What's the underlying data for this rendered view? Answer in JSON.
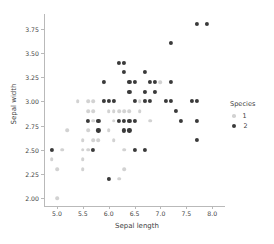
{
  "chart_data": {
    "type": "scatter",
    "title": "",
    "xlabel": "Sepal length",
    "ylabel": "Sepal width",
    "xlim": [
      4.75,
      8.15
    ],
    "ylim": [
      1.92,
      3.88
    ],
    "xticks": [
      "5.0",
      "5.5",
      "6.0",
      "6.5",
      "7.0",
      "7.5",
      "8.0"
    ],
    "xtick_values": [
      5.0,
      5.5,
      6.0,
      6.5,
      7.0,
      7.5,
      8.0
    ],
    "yticks": [
      "2.00",
      "2.25",
      "2.50",
      "2.75",
      "3.00",
      "3.25",
      "3.50",
      "3.75"
    ],
    "ytick_values": [
      2.0,
      2.25,
      2.5,
      2.75,
      3.0,
      3.25,
      3.5,
      3.75
    ],
    "grid": false,
    "legend": {
      "title": "Species",
      "position": "right",
      "entries": [
        {
          "label": "1",
          "color": "#d2d2d2"
        },
        {
          "label": "2",
          "color": "#3a3a3a"
        }
      ]
    },
    "series": [
      {
        "name": "1",
        "color": "#d2d2d2",
        "points": [
          [
            4.9,
            2.4
          ],
          [
            5.0,
            2.3
          ],
          [
            5.0,
            2.0
          ],
          [
            5.1,
            2.5
          ],
          [
            5.2,
            2.7
          ],
          [
            5.4,
            3.0
          ],
          [
            5.5,
            2.6
          ],
          [
            5.5,
            2.5
          ],
          [
            5.5,
            2.4
          ],
          [
            5.5,
            2.3
          ],
          [
            5.6,
            3.0
          ],
          [
            5.6,
            2.9
          ],
          [
            5.6,
            2.7
          ],
          [
            5.6,
            2.5
          ],
          [
            5.7,
            3.0
          ],
          [
            5.7,
            2.9
          ],
          [
            5.7,
            2.8
          ],
          [
            5.7,
            2.6
          ],
          [
            5.8,
            2.7
          ],
          [
            5.8,
            2.6
          ],
          [
            5.9,
            3.2
          ],
          [
            5.9,
            3.0
          ],
          [
            6.0,
            2.9
          ],
          [
            6.0,
            2.7
          ],
          [
            6.0,
            2.2
          ],
          [
            6.1,
            3.0
          ],
          [
            6.1,
            2.9
          ],
          [
            6.1,
            2.8
          ],
          [
            6.1,
            2.6
          ],
          [
            6.2,
            2.9
          ],
          [
            6.2,
            2.2
          ],
          [
            6.3,
            3.4
          ],
          [
            6.3,
            2.9
          ],
          [
            6.3,
            2.5
          ],
          [
            6.3,
            2.3
          ],
          [
            6.4,
            2.9
          ],
          [
            6.5,
            2.8
          ],
          [
            6.6,
            3.0
          ],
          [
            6.6,
            2.9
          ],
          [
            6.7,
            3.1
          ],
          [
            6.7,
            3.0
          ],
          [
            6.8,
            2.8
          ],
          [
            6.9,
            3.1
          ],
          [
            7.0,
            3.2
          ],
          [
            7.7,
            2.8
          ]
        ]
      },
      {
        "name": "2",
        "color": "#3a3a3a",
        "points": [
          [
            4.9,
            2.5
          ],
          [
            5.6,
            2.8
          ],
          [
            5.7,
            2.5
          ],
          [
            5.8,
            2.8
          ],
          [
            5.8,
            2.7
          ],
          [
            5.9,
            3.0
          ],
          [
            5.9,
            3.2
          ],
          [
            6.0,
            3.0
          ],
          [
            6.0,
            2.2
          ],
          [
            6.1,
            3.0
          ],
          [
            6.2,
            3.4
          ],
          [
            6.2,
            2.8
          ],
          [
            6.3,
            3.4
          ],
          [
            6.3,
            3.3
          ],
          [
            6.3,
            2.8
          ],
          [
            6.3,
            2.7
          ],
          [
            6.4,
            3.2
          ],
          [
            6.4,
            3.1
          ],
          [
            6.4,
            2.8
          ],
          [
            6.4,
            2.7
          ],
          [
            6.5,
            3.2
          ],
          [
            6.5,
            3.0
          ],
          [
            6.5,
            2.8
          ],
          [
            6.5,
            2.5
          ],
          [
            6.7,
            3.3
          ],
          [
            6.7,
            3.1
          ],
          [
            6.7,
            3.0
          ],
          [
            6.7,
            2.5
          ],
          [
            6.8,
            3.2
          ],
          [
            6.8,
            3.0
          ],
          [
            6.9,
            3.2
          ],
          [
            6.9,
            3.1
          ],
          [
            7.1,
            3.0
          ],
          [
            7.2,
            3.6
          ],
          [
            7.2,
            3.2
          ],
          [
            7.2,
            3.0
          ],
          [
            7.3,
            2.9
          ],
          [
            7.4,
            2.8
          ],
          [
            7.6,
            3.0
          ],
          [
            7.7,
            3.8
          ],
          [
            7.7,
            3.0
          ],
          [
            7.7,
            2.8
          ],
          [
            7.7,
            2.6
          ],
          [
            7.9,
            3.8
          ]
        ]
      }
    ]
  }
}
